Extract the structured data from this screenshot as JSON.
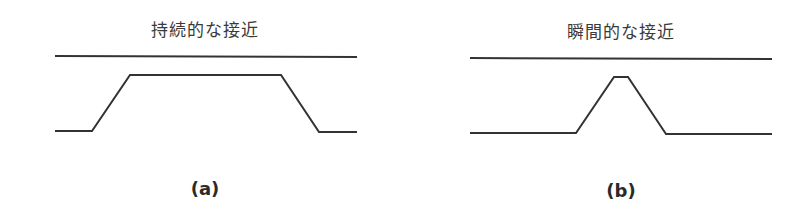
{
  "figure": {
    "stroke_color": "#333333",
    "panels": [
      {
        "id": "a",
        "title": "持続的な接近",
        "label": "(a)",
        "top_line": {
          "x1": 55,
          "y1": 56,
          "x2": 357,
          "y2": 57
        },
        "profile_points": "55,131 92,131 130,75 281,75 319,132 357,132"
      },
      {
        "id": "b",
        "title": "瞬間的な接近",
        "label": "(b)",
        "top_line": {
          "x1": 470,
          "y1": 58,
          "x2": 772,
          "y2": 59
        },
        "profile_points": "470,133 576,133 614,77 628,77 666,134 772,134"
      }
    ]
  }
}
